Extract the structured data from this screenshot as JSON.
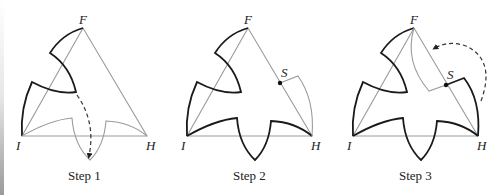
{
  "figure": {
    "panels": [
      {
        "caption": "Step 1",
        "vertices": {
          "top": "F",
          "left": "I",
          "right": "H"
        }
      },
      {
        "caption": "Step 2",
        "vertices": {
          "top": "F",
          "left": "I",
          "right": "H"
        },
        "point": "S"
      },
      {
        "caption": "Step 3",
        "vertices": {
          "top": "F",
          "left": "I",
          "right": "H"
        },
        "point": "S"
      }
    ]
  },
  "colors": {
    "construction_line": "#9b9b9b",
    "outline": "#1a1a1a"
  }
}
